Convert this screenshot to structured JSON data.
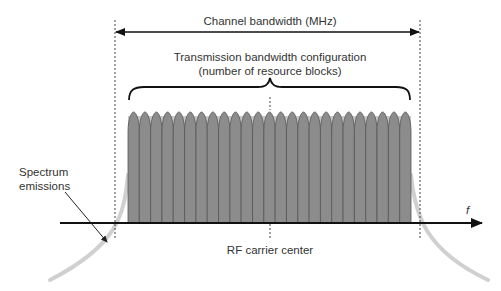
{
  "labels": {
    "channel_bandwidth": "Channel bandwidth (MHz)",
    "transmission_config_line1": "Transmission bandwidth configuration",
    "transmission_config_line2": "(number of resource blocks)",
    "spectrum_line1": "Spectrum",
    "spectrum_line2": "emissions",
    "rf_carrier": "RF carrier center",
    "freq_axis": "f"
  },
  "geometry": {
    "resource_block_count": 25,
    "left_edge_x": 115,
    "right_edge_x": 420,
    "center_x": 270,
    "axis_y": 223
  },
  "colors": {
    "block_fill": "#8c8c8c",
    "block_stroke": "#555555",
    "block_halo": "#c8c8c8",
    "emission": "#cfcfcf",
    "line": "#111111",
    "text": "#333333"
  }
}
